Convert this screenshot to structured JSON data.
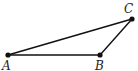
{
  "diagram": {
    "type": "triangle",
    "stroke_color": "#111111",
    "points": [
      {
        "name": "A",
        "label": "A",
        "x": 8,
        "y": 55,
        "lx": 2,
        "ly": 70
      },
      {
        "name": "B",
        "label": "B",
        "x": 100,
        "y": 55,
        "lx": 95,
        "ly": 70
      },
      {
        "name": "C",
        "label": "C",
        "x": 132,
        "y": 19,
        "lx": 124,
        "ly": 13
      }
    ],
    "segments": [
      [
        "A",
        "B"
      ],
      [
        "B",
        "C"
      ],
      [
        "A",
        "C"
      ]
    ]
  }
}
